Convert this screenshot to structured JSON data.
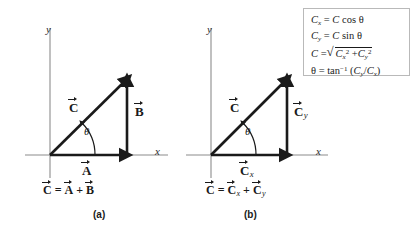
{
  "figure": {
    "background_color": "#ffffff",
    "ink_color": "#1a1a1a",
    "axis_color": "#8c8c8c"
  },
  "panel_a": {
    "label": "(a)",
    "x_axis_label": "x",
    "y_axis_label": "y",
    "angle_label": "θ",
    "vectors": [
      {
        "name": "C",
        "letter": "C",
        "subscript": ""
      },
      {
        "name": "A",
        "letter": "A",
        "subscript": ""
      },
      {
        "name": "B",
        "letter": "B",
        "subscript": ""
      }
    ],
    "caption": {
      "lhs_letter": "C",
      "equals": "=",
      "term1_letter": "A",
      "plus": "+",
      "term2_letter": "B"
    }
  },
  "panel_b": {
    "label": "(b)",
    "x_axis_label": "x",
    "y_axis_label": "y",
    "angle_label": "θ",
    "vectors": [
      {
        "name": "C",
        "letter": "C",
        "subscript": ""
      },
      {
        "name": "Cx",
        "letter": "C",
        "subscript": "x"
      },
      {
        "name": "Cy",
        "letter": "C",
        "subscript": "y"
      }
    ],
    "caption": {
      "lhs_letter": "C",
      "equals": "=",
      "term1_letter": "C",
      "term1_subscript": "x",
      "plus": "+",
      "term2_letter": "C",
      "term2_subscript": "y"
    }
  },
  "formula_box": {
    "border_color": "#b9b9b9",
    "equations": [
      {
        "id": "cx",
        "lhs": "C",
        "lhs_sub": "x",
        "eq": "=",
        "rhs_var": "C",
        "rhs_fn": "cos",
        "rhs_angle": "θ"
      },
      {
        "id": "cy",
        "lhs": "C",
        "lhs_sub": "y",
        "eq": "=",
        "rhs_var": "C",
        "rhs_fn": "sin",
        "rhs_angle": "θ"
      },
      {
        "id": "magnitude",
        "lhs": "C",
        "eq": "=",
        "radicand_1": "C",
        "radicand_1_sub": "x",
        "radicand_1_sup": "2",
        "radicand_plus": "+",
        "radicand_2": "C",
        "radicand_2_sub": "y",
        "radicand_2_sup": "2"
      },
      {
        "id": "angle",
        "lhs": "θ",
        "eq": "=",
        "fn": "tan",
        "fn_sup": "−1",
        "open_paren": "(",
        "num": "C",
        "num_sub": "y",
        "slash": "/",
        "den": "C",
        "den_sub": "x",
        "close_paren": ")"
      }
    ]
  }
}
